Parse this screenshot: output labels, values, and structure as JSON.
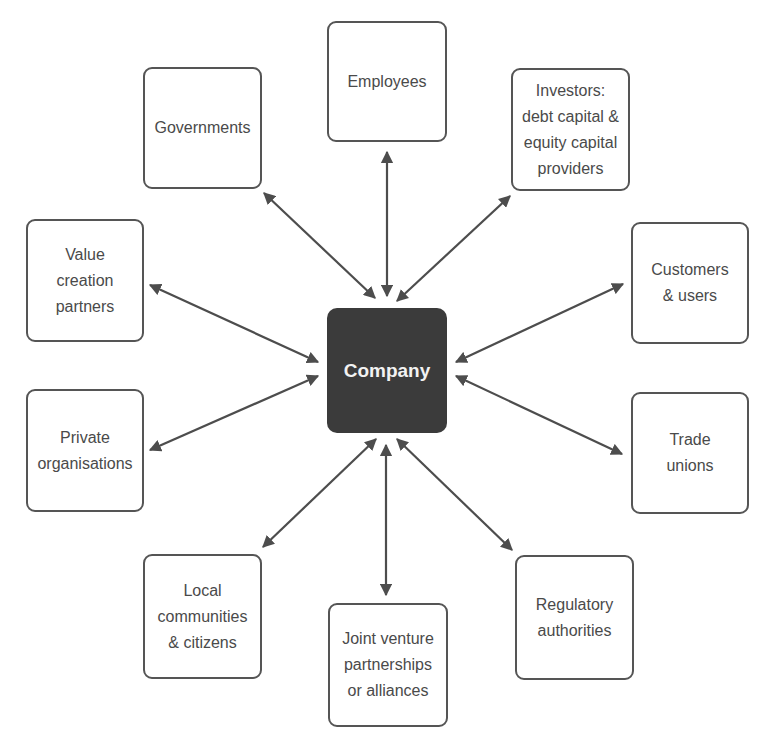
{
  "diagram": {
    "center": {
      "label": "Company",
      "fill": "#3b3b3b",
      "text_color": "#f2f2f2"
    },
    "stakeholders": [
      {
        "id": "employees",
        "label": "Employees",
        "x": 327,
        "y": 21,
        "w": 120,
        "h": 121,
        "arrow": [
          387,
          152,
          387,
          296
        ]
      },
      {
        "id": "governments",
        "label": "Governments",
        "x": 143,
        "y": 67,
        "w": 119,
        "h": 122,
        "arrow": [
          264,
          193,
          375,
          298
        ]
      },
      {
        "id": "investors",
        "label": "Investors:\ndebt capital &\nequity capital\nproviders",
        "x": 511,
        "y": 68,
        "w": 119,
        "h": 123,
        "arrow": [
          510,
          196,
          397,
          301
        ]
      },
      {
        "id": "value-creation-partners",
        "label": "Value\ncreation\npartners",
        "x": 26,
        "y": 219,
        "w": 118,
        "h": 123,
        "arrow": [
          150,
          285,
          318,
          362
        ]
      },
      {
        "id": "customers-users",
        "label": "Customers\n& users",
        "x": 631,
        "y": 222,
        "w": 118,
        "h": 122,
        "arrow": [
          623,
          284,
          456,
          362
        ]
      },
      {
        "id": "private-organisations",
        "label": "Private\norganisations",
        "x": 26,
        "y": 389,
        "w": 118,
        "h": 123,
        "arrow": [
          150,
          450,
          318,
          376
        ]
      },
      {
        "id": "trade-unions",
        "label": "Trade\nunions",
        "x": 631,
        "y": 392,
        "w": 118,
        "h": 122,
        "arrow": [
          622,
          454,
          456,
          376
        ]
      },
      {
        "id": "local-communities",
        "label": "Local\ncommunities\n& citizens",
        "x": 143,
        "y": 554,
        "w": 119,
        "h": 125,
        "arrow": [
          263,
          547,
          376,
          439
        ]
      },
      {
        "id": "joint-venture",
        "label": "Joint venture\npartnerships\nor alliances",
        "x": 328,
        "y": 603,
        "w": 120,
        "h": 124,
        "arrow": [
          386,
          595,
          386,
          445
        ]
      },
      {
        "id": "regulatory-authorities",
        "label": "Regulatory\nauthorities",
        "x": 515,
        "y": 555,
        "w": 119,
        "h": 125,
        "arrow": [
          512,
          550,
          397,
          439
        ]
      }
    ],
    "center_box": {
      "x": 327,
      "y": 308,
      "w": 120,
      "h": 125
    },
    "colors": {
      "border": "#555555",
      "arrow": "#4d4d4d",
      "text": "#4a4a4a",
      "background": "#ffffff"
    },
    "arrow_style": "double-headed"
  }
}
